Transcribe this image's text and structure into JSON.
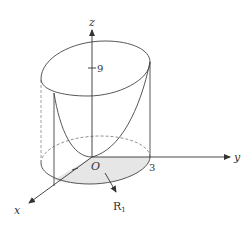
{
  "diagram": {
    "axes": {
      "x_label": "x",
      "y_label": "y",
      "z_label": "z",
      "origin_label": "O"
    },
    "ticks": {
      "z_tick": "9",
      "y_tick": "3"
    },
    "region_label": "R",
    "region_subscript": "1",
    "colors": {
      "line": "#444444",
      "dashed": "#777777",
      "shade": "#e6e6e6"
    }
  }
}
